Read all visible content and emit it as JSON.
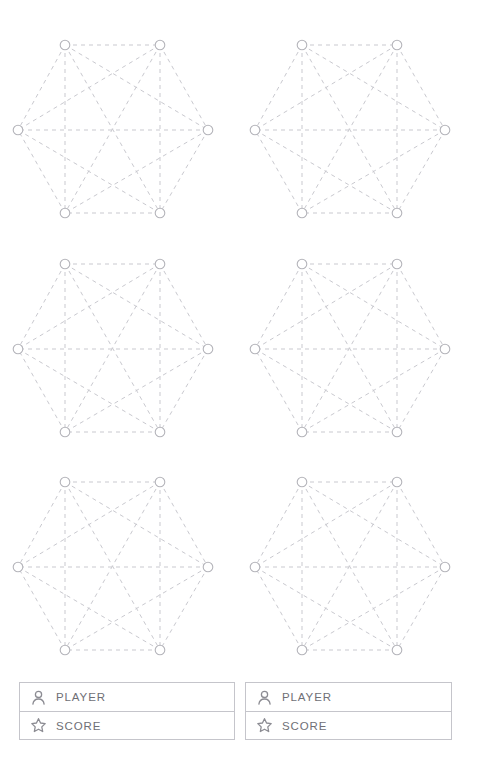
{
  "canvas": {
    "width": 481,
    "height": 781,
    "background": "#ffffff"
  },
  "graph_style": {
    "edge_color": "#c9c9cf",
    "edge_dash": "4 4",
    "edge_width": 1,
    "node_stroke": "#b4b4ba",
    "node_fill": "#ffffff",
    "node_radius": 4.8
  },
  "board": {
    "name": "hexagon-graph-board",
    "rows": 3,
    "columns": 2,
    "graph_type": "complete-graph-k6",
    "node_count_per_graph": 6,
    "edge_count_per_graph": 15,
    "hexagons": [
      {
        "id": "hex-1",
        "row": 1,
        "column": 1,
        "left": 8,
        "top": 25
      },
      {
        "id": "hex-2",
        "row": 1,
        "column": 2,
        "left": 245,
        "top": 25
      },
      {
        "id": "hex-3",
        "row": 2,
        "column": 1,
        "left": 8,
        "top": 244
      },
      {
        "id": "hex-4",
        "row": 2,
        "column": 2,
        "left": 245,
        "top": 244
      },
      {
        "id": "hex-5",
        "row": 3,
        "column": 1,
        "left": 8,
        "top": 462
      },
      {
        "id": "hex-6",
        "row": 3,
        "column": 2,
        "left": 245,
        "top": 462
      }
    ],
    "vertices": [
      {
        "id": "v1",
        "label": "top-left",
        "x": 57,
        "y": 20
      },
      {
        "id": "v2",
        "label": "top-right",
        "x": 152,
        "y": 20
      },
      {
        "id": "v3",
        "label": "right",
        "x": 200,
        "y": 105
      },
      {
        "id": "v4",
        "label": "bottom-right",
        "x": 152,
        "y": 188
      },
      {
        "id": "v5",
        "label": "bottom-left",
        "x": 57,
        "y": 188
      },
      {
        "id": "v6",
        "label": "left",
        "x": 10,
        "y": 105
      }
    ],
    "edges": [
      [
        "v1",
        "v2"
      ],
      [
        "v1",
        "v3"
      ],
      [
        "v1",
        "v4"
      ],
      [
        "v1",
        "v5"
      ],
      [
        "v1",
        "v6"
      ],
      [
        "v2",
        "v3"
      ],
      [
        "v2",
        "v4"
      ],
      [
        "v2",
        "v5"
      ],
      [
        "v2",
        "v6"
      ],
      [
        "v3",
        "v4"
      ],
      [
        "v3",
        "v5"
      ],
      [
        "v3",
        "v6"
      ],
      [
        "v4",
        "v5"
      ],
      [
        "v4",
        "v6"
      ],
      [
        "v5",
        "v6"
      ]
    ]
  },
  "panels": {
    "cards": [
      {
        "id": "score-card-left",
        "rows": [
          {
            "icon": "person-icon",
            "label": "PLAYER",
            "value": ""
          },
          {
            "icon": "star-icon",
            "label": "SCORE",
            "value": ""
          }
        ]
      },
      {
        "id": "score-card-right",
        "rows": [
          {
            "icon": "person-icon",
            "label": "PLAYER",
            "value": ""
          },
          {
            "icon": "star-icon",
            "label": "SCORE",
            "value": ""
          }
        ]
      }
    ],
    "border_color": "#c5c5cb",
    "label_color": "#6f6f76",
    "icon_color": "#8c8c93"
  }
}
